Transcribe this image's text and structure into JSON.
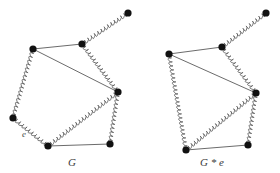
{
  "figure": {
    "type": "diagram",
    "background_color": "#ffffff",
    "node_color": "#111111",
    "thick_edge_color": "#555555",
    "thin_edge_color": "#5a5a5a",
    "node_radius": 3.6,
    "graphs": [
      {
        "id": "G",
        "caption": "G",
        "caption_pos": {
          "x": 72,
          "y": 166
        },
        "edge_label": "e",
        "edge_label_pos": {
          "x": 24,
          "y": 137
        },
        "nodes": [
          {
            "id": "p",
            "label": "",
            "x": 128,
            "y": 13
          },
          {
            "id": "t",
            "label": "",
            "x": 82,
            "y": 44
          },
          {
            "id": "a",
            "label": "",
            "x": 33,
            "y": 49
          },
          {
            "id": "r",
            "label": "",
            "x": 118,
            "y": 92
          },
          {
            "id": "l",
            "label": "",
            "x": 13,
            "y": 118
          },
          {
            "id": "b",
            "label": "",
            "x": 48,
            "y": 146
          },
          {
            "id": "c",
            "label": "",
            "x": 110,
            "y": 144
          }
        ],
        "edges": [
          {
            "from": "t",
            "to": "p",
            "style": "coil"
          },
          {
            "from": "a",
            "to": "t",
            "style": "line"
          },
          {
            "from": "a",
            "to": "r",
            "style": "line"
          },
          {
            "from": "t",
            "to": "r",
            "style": "coil"
          },
          {
            "from": "a",
            "to": "l",
            "style": "coil",
            "label": "e"
          },
          {
            "from": "l",
            "to": "b",
            "style": "coil"
          },
          {
            "from": "b",
            "to": "r",
            "style": "coil"
          },
          {
            "from": "r",
            "to": "c",
            "style": "coil"
          },
          {
            "from": "b",
            "to": "c",
            "style": "line"
          }
        ]
      },
      {
        "id": "Ge",
        "caption": "G * e",
        "caption_pos": {
          "x": 212,
          "y": 166
        },
        "nodes": [
          {
            "id": "p",
            "label": "",
            "x": 266,
            "y": 13
          },
          {
            "id": "t",
            "label": "",
            "x": 222,
            "y": 47
          },
          {
            "id": "a",
            "label": "",
            "x": 169,
            "y": 54
          },
          {
            "id": "r",
            "label": "",
            "x": 256,
            "y": 93
          },
          {
            "id": "b",
            "label": "",
            "x": 186,
            "y": 150
          },
          {
            "id": "c",
            "label": "",
            "x": 248,
            "y": 145
          }
        ],
        "edges": [
          {
            "from": "t",
            "to": "p",
            "style": "coil"
          },
          {
            "from": "a",
            "to": "t",
            "style": "line"
          },
          {
            "from": "a",
            "to": "r",
            "style": "line"
          },
          {
            "from": "t",
            "to": "r",
            "style": "coil"
          },
          {
            "from": "a",
            "to": "b",
            "style": "coil"
          },
          {
            "from": "b",
            "to": "r",
            "style": "coil"
          },
          {
            "from": "r",
            "to": "c",
            "style": "coil"
          },
          {
            "from": "b",
            "to": "c",
            "style": "line"
          }
        ]
      }
    ]
  }
}
